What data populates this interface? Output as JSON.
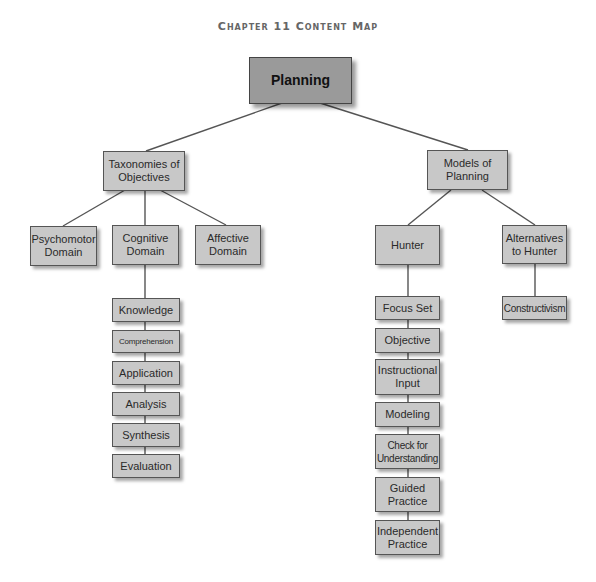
{
  "title": "Chapter 11 Content Map",
  "colors": {
    "root_fill": "#9a9a9a",
    "node_fill": "#c8c8c8",
    "border": "#555555",
    "line": "#555555",
    "title": "#666666"
  },
  "root": {
    "label": "Planning"
  },
  "branches": [
    {
      "label": "Taxonomies of Objectives",
      "children": [
        {
          "label": "Psychomotor Domain"
        },
        {
          "label": "Cognitive Domain",
          "steps": [
            "Knowledge",
            "Comprehension",
            "Application",
            "Analysis",
            "Synthesis",
            "Evaluation"
          ]
        },
        {
          "label": "Affective Domain"
        }
      ]
    },
    {
      "label": "Models of Planning",
      "children": [
        {
          "label": "Hunter",
          "steps": [
            "Focus Set",
            "Objective",
            "Instructional Input",
            "Modeling",
            "Check for Understanding",
            "Guided Practice",
            "Independent Practice"
          ]
        },
        {
          "label": "Alternatives to Hunter",
          "steps": [
            "Constructivism"
          ]
        }
      ]
    }
  ]
}
